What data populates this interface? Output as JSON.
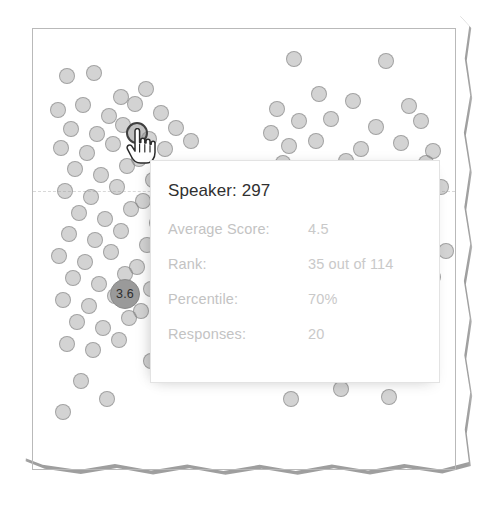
{
  "chart_data": {
    "type": "scatter",
    "title": "",
    "xlabel": "",
    "ylabel": "",
    "grid": "single dashed horizontal gridline",
    "legend": "none",
    "marker_color": "#969696",
    "marker_edge_color": "#787878",
    "highlight_label": "3.6",
    "clusters": [
      {
        "name": "left-cluster",
        "points": [
          [
            66,
            75
          ],
          [
            93,
            72
          ],
          [
            120,
            96
          ],
          [
            145,
            88
          ],
          [
            57,
            109
          ],
          [
            82,
            104
          ],
          [
            108,
            115
          ],
          [
            134,
            103
          ],
          [
            160,
            112
          ],
          [
            70,
            128
          ],
          [
            96,
            133
          ],
          [
            122,
            124
          ],
          [
            148,
            138
          ],
          [
            175,
            127
          ],
          [
            60,
            147
          ],
          [
            86,
            152
          ],
          [
            112,
            143
          ],
          [
            138,
            158
          ],
          [
            164,
            148
          ],
          [
            190,
            140
          ],
          [
            74,
            168
          ],
          [
            100,
            174
          ],
          [
            126,
            165
          ],
          [
            152,
            179
          ],
          [
            178,
            170
          ],
          [
            64,
            190
          ],
          [
            90,
            196
          ],
          [
            116,
            186
          ],
          [
            142,
            200
          ],
          [
            168,
            191
          ],
          [
            78,
            212
          ],
          [
            104,
            218
          ],
          [
            130,
            208
          ],
          [
            156,
            222
          ],
          [
            182,
            213
          ],
          [
            68,
            233
          ],
          [
            94,
            239
          ],
          [
            120,
            230
          ],
          [
            146,
            244
          ],
          [
            58,
            255
          ],
          [
            84,
            261
          ],
          [
            110,
            251
          ],
          [
            136,
            266
          ],
          [
            72,
            277
          ],
          [
            98,
            283
          ],
          [
            124,
            273
          ],
          [
            150,
            288
          ],
          [
            62,
            299
          ],
          [
            88,
            305
          ],
          [
            114,
            295
          ],
          [
            140,
            310
          ],
          [
            76,
            321
          ],
          [
            102,
            327
          ],
          [
            128,
            317
          ],
          [
            66,
            343
          ],
          [
            92,
            349
          ],
          [
            118,
            339
          ],
          [
            150,
            360
          ],
          [
            80,
            380
          ],
          [
            106,
            398
          ],
          [
            62,
            411
          ]
        ]
      },
      {
        "name": "right-cluster",
        "points": [
          [
            293,
            58
          ],
          [
            385,
            60
          ],
          [
            318,
            93
          ],
          [
            276,
            108
          ],
          [
            352,
            100
          ],
          [
            408,
            105
          ],
          [
            298,
            120
          ],
          [
            270,
            132
          ],
          [
            330,
            118
          ],
          [
            375,
            126
          ],
          [
            420,
            120
          ],
          [
            288,
            145
          ],
          [
            315,
            140
          ],
          [
            360,
            148
          ],
          [
            400,
            142
          ],
          [
            432,
            150
          ],
          [
            282,
            162
          ],
          [
            308,
            170
          ],
          [
            345,
            160
          ],
          [
            390,
            168
          ],
          [
            425,
            162
          ],
          [
            300,
            184
          ],
          [
            330,
            190
          ],
          [
            368,
            182
          ],
          [
            405,
            192
          ],
          [
            440,
            186
          ],
          [
            292,
            205
          ],
          [
            320,
            212
          ],
          [
            355,
            204
          ],
          [
            395,
            214
          ],
          [
            430,
            208
          ],
          [
            310,
            228
          ],
          [
            340,
            236
          ],
          [
            378,
            226
          ],
          [
            415,
            234
          ],
          [
            300,
            250
          ],
          [
            335,
            258
          ],
          [
            372,
            248
          ],
          [
            410,
            256
          ],
          [
            445,
            250
          ],
          [
            358,
            278
          ],
          [
            395,
            286
          ],
          [
            432,
            276
          ],
          [
            385,
            305
          ],
          [
            420,
            312
          ],
          [
            360,
            330
          ],
          [
            400,
            340
          ],
          [
            300,
            372
          ],
          [
            340,
            388
          ],
          [
            290,
            398
          ],
          [
            388,
            396
          ]
        ]
      }
    ],
    "highlight_point": {
      "x": 124,
      "y": 293,
      "label": "3.6",
      "radius": 15
    },
    "hover_point": {
      "x": 136,
      "y": 132,
      "radius": 11
    }
  },
  "tooltip": {
    "title": "Speaker: 297",
    "rows": [
      {
        "label": "Average Score:",
        "value": "4.5"
      },
      {
        "label": "Rank:",
        "value": "35 out of 114"
      },
      {
        "label": "Percentile:",
        "value": "70%"
      },
      {
        "label": "Responses:",
        "value": "20"
      }
    ]
  },
  "cursor": {
    "icon": "pointing-hand-cursor"
  }
}
